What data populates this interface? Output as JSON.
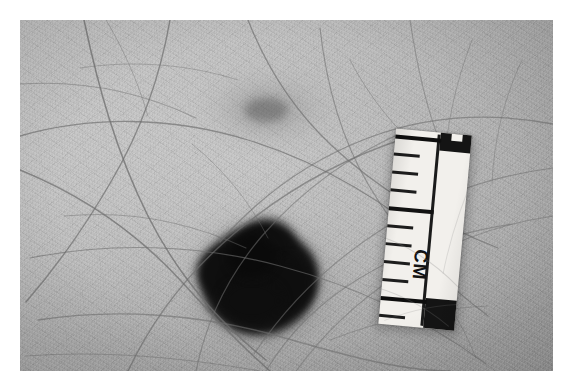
{
  "image": {
    "kind": "clinical-dermatology-photograph",
    "modality": "grayscale film photograph",
    "subject": "pigmented skin lesion on hair-bearing skin with measurement scale",
    "border_color": "#ffffff",
    "skin_color": "#c2c2c2",
    "lesion_color": "#131313"
  },
  "photo": {
    "caption": "",
    "frame": {
      "left": 20,
      "top": 20,
      "width": 533,
      "height": 351
    }
  },
  "lesion": {
    "name": "pigmented-lesion",
    "label": "",
    "description": "dark irregular pigmented macule with diffuse blurred border",
    "color": "#131313",
    "halo_color": "#4a4a4a"
  },
  "macule": {
    "name": "faint-secondary-macule",
    "label": "",
    "description": "faint light-brown blush of pigment, ill-defined",
    "color": "#5a5a5a"
  },
  "ruler": {
    "name": "measurement-ruler",
    "unit_label": "CM",
    "body_color": "#f2f0ec",
    "mark_color": "#141414",
    "rotation_deg": 5.2,
    "ticks": [
      {
        "y": 6,
        "type": "datum"
      },
      {
        "y": 24,
        "type": "minor"
      },
      {
        "y": 42,
        "type": "minor"
      },
      {
        "y": 60,
        "type": "minor"
      },
      {
        "y": 78,
        "type": "major"
      },
      {
        "y": 96,
        "type": "minor"
      },
      {
        "y": 114,
        "type": "minor"
      },
      {
        "y": 132,
        "type": "minor"
      },
      {
        "y": 150,
        "type": "minor"
      },
      {
        "y": 168,
        "type": "datum"
      },
      {
        "y": 186,
        "type": "minor"
      }
    ]
  },
  "hairs": {
    "name": "hair-strands",
    "color": "#6f6f6f",
    "count": 26
  }
}
